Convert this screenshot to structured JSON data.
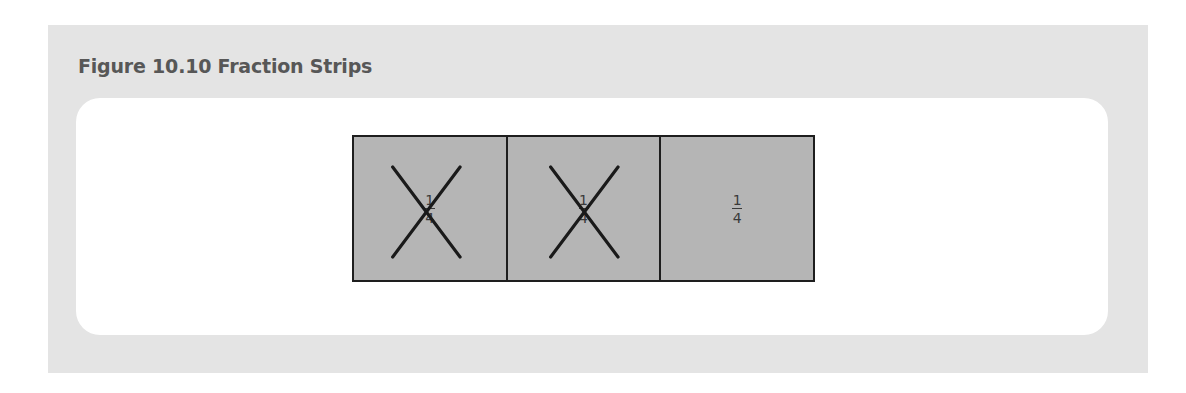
{
  "figure": {
    "title": "Figure 10.10 Fraction Strips",
    "colors": {
      "panel_bg": "#e4e4e4",
      "card_bg": "#ffffff",
      "cell_fill": "#b5b5b5",
      "stroke": "#1e1e1e",
      "title_text": "#575757"
    },
    "strip": {
      "cells": [
        {
          "numerator": "1",
          "denominator": "4",
          "crossed_out": true
        },
        {
          "numerator": "1",
          "denominator": "4",
          "crossed_out": true
        },
        {
          "numerator": "1",
          "denominator": "4",
          "crossed_out": false
        }
      ]
    }
  }
}
